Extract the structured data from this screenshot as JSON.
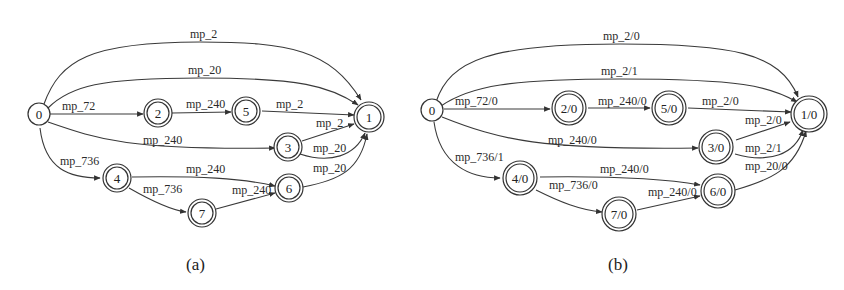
{
  "figures": [
    {
      "caption": "(a)",
      "nodes": [
        {
          "id": "0",
          "label": "0",
          "accepting": false
        },
        {
          "id": "2",
          "label": "2",
          "accepting": true
        },
        {
          "id": "5",
          "label": "5",
          "accepting": true
        },
        {
          "id": "1",
          "label": "1",
          "accepting": true
        },
        {
          "id": "3",
          "label": "3",
          "accepting": true
        },
        {
          "id": "4",
          "label": "4",
          "accepting": true
        },
        {
          "id": "6",
          "label": "6",
          "accepting": true
        },
        {
          "id": "7",
          "label": "7",
          "accepting": true
        }
      ],
      "edges": [
        {
          "from": "0",
          "to": "1",
          "label": "mp_2"
        },
        {
          "from": "0",
          "to": "1",
          "label": "mp_20"
        },
        {
          "from": "0",
          "to": "2",
          "label": "mp_72"
        },
        {
          "from": "2",
          "to": "5",
          "label": "mp_240"
        },
        {
          "from": "5",
          "to": "1",
          "label": "mp_2"
        },
        {
          "from": "3",
          "to": "1",
          "label": "mp_2"
        },
        {
          "from": "0",
          "to": "3",
          "label": "mp_240"
        },
        {
          "from": "3",
          "to": "1",
          "label": "mp_20"
        },
        {
          "from": "0",
          "to": "4",
          "label": "mp_736"
        },
        {
          "from": "4",
          "to": "6",
          "label": "mp_240"
        },
        {
          "from": "4",
          "to": "7",
          "label": "mp_736"
        },
        {
          "from": "7",
          "to": "6",
          "label": "mp_240"
        },
        {
          "from": "6",
          "to": "1",
          "label": "mp_20"
        }
      ]
    },
    {
      "caption": "(b)",
      "nodes": [
        {
          "id": "0",
          "label": "0",
          "accepting": false
        },
        {
          "id": "20",
          "label": "2/0",
          "accepting": true
        },
        {
          "id": "50",
          "label": "5/0",
          "accepting": true
        },
        {
          "id": "10",
          "label": "1/0",
          "accepting": true
        },
        {
          "id": "30",
          "label": "3/0",
          "accepting": true
        },
        {
          "id": "40",
          "label": "4/0",
          "accepting": true
        },
        {
          "id": "60",
          "label": "6/0",
          "accepting": true
        },
        {
          "id": "70",
          "label": "7/0",
          "accepting": true
        }
      ],
      "edges": [
        {
          "from": "0",
          "to": "10",
          "label": "mp_2/0"
        },
        {
          "from": "0",
          "to": "10",
          "label": "mp_2/1"
        },
        {
          "from": "0",
          "to": "20",
          "label": "mp_72/0"
        },
        {
          "from": "20",
          "to": "50",
          "label": "mp_240/0"
        },
        {
          "from": "50",
          "to": "10",
          "label": "mp_2/0"
        },
        {
          "from": "30",
          "to": "10",
          "label": "mp_2/0"
        },
        {
          "from": "0",
          "to": "30",
          "label": "mp_240/0"
        },
        {
          "from": "30",
          "to": "10",
          "label": "mp_2/1"
        },
        {
          "from": "0",
          "to": "40",
          "label": "mp_736/1"
        },
        {
          "from": "40",
          "to": "60",
          "label": "mp_240/0"
        },
        {
          "from": "40",
          "to": "70",
          "label": "mp_736/0"
        },
        {
          "from": "70",
          "to": "60",
          "label": "mp_240/0"
        },
        {
          "from": "60",
          "to": "10",
          "label": "mp_20/0"
        }
      ]
    }
  ]
}
